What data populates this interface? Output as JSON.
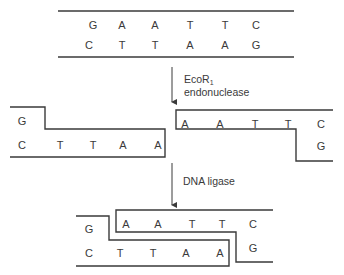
{
  "intact_dna": {
    "top_strand": [
      "G",
      "A",
      "A",
      "T",
      "T",
      "C"
    ],
    "bottom_strand": [
      "C",
      "T",
      "T",
      "A",
      "A",
      "G"
    ]
  },
  "step1": {
    "enzyme_line1": "EcoR",
    "enzyme_subscript": "1",
    "enzyme_line2": "endonuclease"
  },
  "cut_fragments": {
    "left": {
      "top_strand": [
        "G"
      ],
      "bottom_strand": [
        "C",
        "T",
        "T",
        "A",
        "A"
      ]
    },
    "right": {
      "top_strand": [
        "A",
        "A",
        "T",
        "T",
        "C"
      ],
      "bottom_strand": [
        "G"
      ]
    }
  },
  "step2": {
    "enzyme": "DNA ligase"
  },
  "ligated_dna": {
    "left": {
      "top_strand": [
        "G"
      ],
      "bottom_strand": [
        "C",
        "T",
        "T",
        "A",
        "A"
      ]
    },
    "right": {
      "top_strand": [
        "A",
        "A",
        "T",
        "T",
        "C"
      ],
      "bottom_strand": [
        "G"
      ]
    }
  },
  "colors": {
    "ink": "#3a3a3a",
    "background": "#ffffff"
  }
}
